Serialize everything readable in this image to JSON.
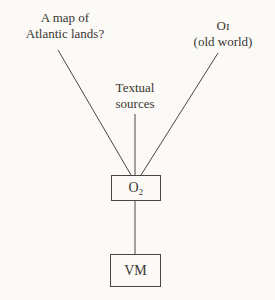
{
  "diagram": {
    "nodes": {
      "atlantic_map": {
        "line1": "A map of",
        "line2": "Atlantic lands?"
      },
      "o1": {
        "line1": "Oɪ",
        "line2": "(old world)"
      },
      "textual": {
        "line1": "Textual",
        "line2": "sources"
      },
      "o2": {
        "label": "O₂"
      },
      "vm": {
        "label": "VM"
      }
    },
    "edges": [
      {
        "from": "atlantic_map",
        "to": "o2"
      },
      {
        "from": "textual",
        "to": "o2"
      },
      {
        "from": "o1",
        "to": "o2"
      },
      {
        "from": "o2",
        "to": "vm"
      }
    ],
    "colors": {
      "line": "#4a4643",
      "background": "#fbfaf6",
      "text": "#3a3633"
    }
  }
}
